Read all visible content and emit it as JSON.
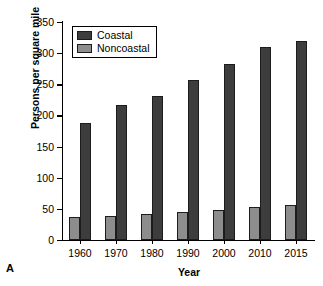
{
  "panel": {
    "letter": "A"
  },
  "chart_data": {
    "type": "bar",
    "title": "",
    "xlabel": "Year",
    "ylabel": "Persons per square mile",
    "categories": [
      "1960",
      "1970",
      "1980",
      "1990",
      "2000",
      "2010",
      "2015"
    ],
    "series": [
      {
        "name": "Coastal",
        "color": "#3d3d3d",
        "values": [
          188,
          216,
          232,
          257,
          282,
          310,
          319
        ]
      },
      {
        "name": "Noncoastal",
        "color": "#8d8d8d",
        "values": [
          37,
          39,
          42,
          45,
          48,
          53,
          57
        ]
      }
    ],
    "ylim": [
      0,
      350
    ],
    "yticks": [
      0,
      50,
      100,
      150,
      200,
      250,
      300,
      350
    ],
    "grid": false,
    "legend_position": "top-left"
  }
}
